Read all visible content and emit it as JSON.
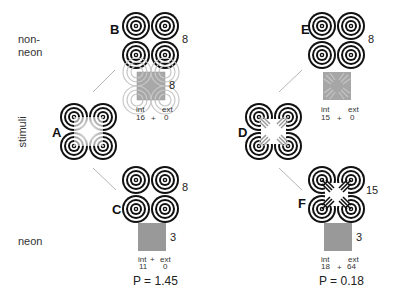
{
  "rows": {
    "top_label": [
      "non-",
      "neon"
    ],
    "bottom_label": "neon",
    "side_label": "stimuli"
  },
  "panels": {
    "A": {
      "letter": "A",
      "type": "stimulus",
      "overlay": "illusory-white-square"
    },
    "B": {
      "letter": "B",
      "count": "8",
      "patch_count": "8",
      "int_label": "int",
      "ext_label": "ext",
      "int": "16",
      "plus": "+",
      "ext": "0"
    },
    "C": {
      "letter": "C",
      "count": "8",
      "patch_count": "3",
      "int_label": "int",
      "plus_top": "+",
      "ext_label": "ext",
      "int": "11",
      "ext": "0",
      "p": "P = 1.45"
    },
    "D": {
      "letter": "D",
      "type": "stimulus",
      "overlay": "neon-white-square-with-rays"
    },
    "E": {
      "letter": "E",
      "count": "8",
      "int_label": "int",
      "ext_label": "ext",
      "int": "15",
      "plus": "+",
      "ext": "0"
    },
    "F": {
      "letter": "F",
      "count": "15",
      "patch_count": "3",
      "int_label": "int",
      "ext_label": "ext",
      "int": "18",
      "plus": "+",
      "ext": "64",
      "p": "P = 0.18"
    }
  },
  "colors": {
    "ring": "#111111",
    "patch_gray": "#9a9a9a",
    "connector": "#b0b0b0"
  }
}
